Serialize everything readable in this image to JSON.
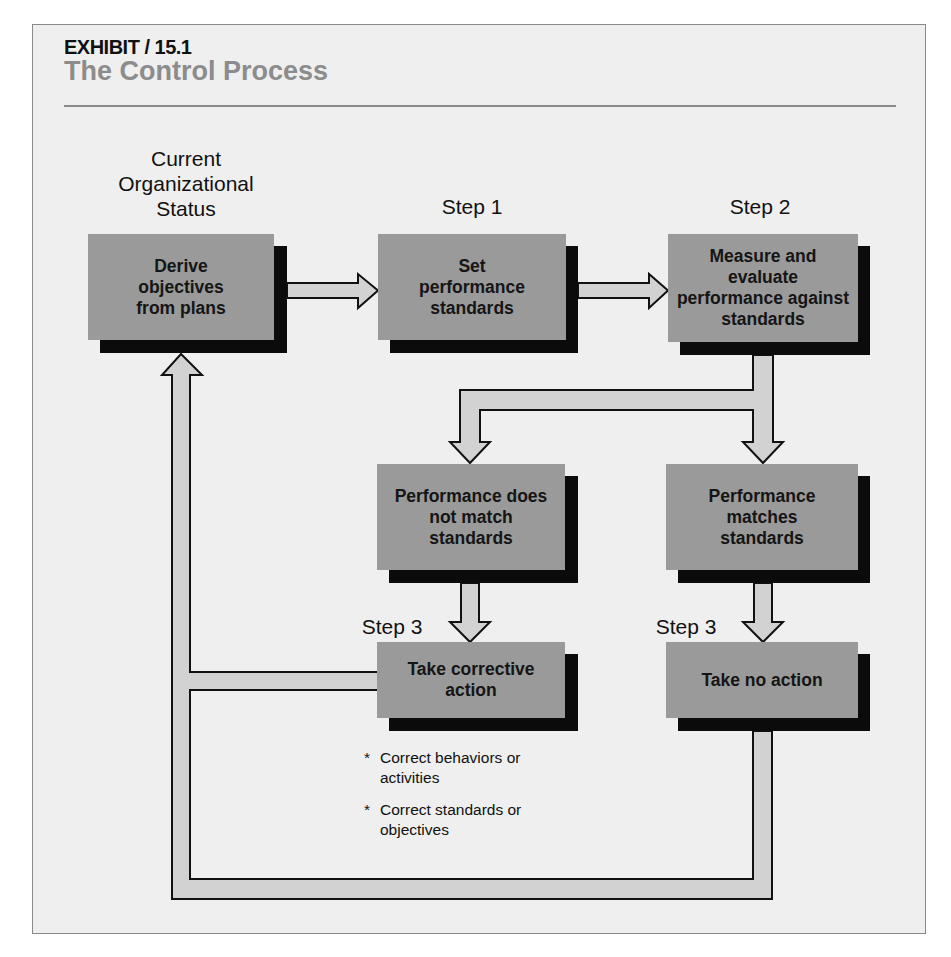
{
  "header": {
    "exhibit_label": "EXHIBIT / 15.1",
    "title": "The Control Process"
  },
  "labels": {
    "current_status": "Current Organizational Status",
    "step1": "Step 1",
    "step2": "Step 2",
    "step3_left": "Step 3",
    "step3_right": "Step 3"
  },
  "boxes": {
    "derive": "Derive objectives from plans",
    "set_standards": "Set performance standards",
    "measure": "Measure and evaluate performance against standards",
    "not_match": "Performance does not match standards",
    "matches": "Performance matches standards",
    "corrective": "Take corrective action",
    "no_action": "Take no action"
  },
  "corrective_notes": [
    "Correct behaviors or activities",
    "Correct standards or objectives"
  ],
  "colors": {
    "panel_bg": "#efefef",
    "box_fill": "#9a9a9a",
    "box_shadow": "#0b0b0b",
    "arrow_fill": "#d2d2d2",
    "title_gray": "#8c8c8c"
  }
}
